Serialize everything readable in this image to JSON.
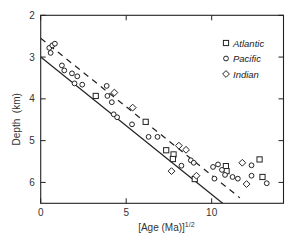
{
  "chart_data": {
    "type": "scatter",
    "title": "",
    "xlabel": "[Age (Ma)]",
    "xlabel_superscript": "1/2",
    "ylabel": "Depth  (km)",
    "xlim": [
      0,
      14.2
    ],
    "ylim": [
      6.5,
      2
    ],
    "y_inverted": true,
    "x_ticks": [
      0,
      5,
      10
    ],
    "x_tick_labels": [
      "0",
      "5",
      "10"
    ],
    "y_ticks": [
      2,
      3,
      4,
      5,
      6
    ],
    "y_tick_labels": [
      "2",
      "3",
      "4",
      "5",
      "6"
    ],
    "grid": false,
    "legend_position": "upper right",
    "series": [
      {
        "name": "Atlantic",
        "marker": "square",
        "points": [
          [
            3.22,
            3.93
          ],
          [
            6.14,
            4.55
          ],
          [
            7.34,
            5.23
          ],
          [
            7.77,
            5.33
          ],
          [
            7.73,
            5.44
          ],
          [
            9.01,
            5.92
          ],
          [
            10.83,
            5.61
          ],
          [
            10.87,
            5.73
          ],
          [
            12.8,
            5.45
          ],
          [
            12.97,
            5.87
          ]
        ]
      },
      {
        "name": "Pacific",
        "marker": "circle",
        "points": [
          [
            0.5,
            2.78
          ],
          [
            0.58,
            2.9
          ],
          [
            0.68,
            2.72
          ],
          [
            0.83,
            2.68
          ],
          [
            1.24,
            3.2
          ],
          [
            1.38,
            3.32
          ],
          [
            1.83,
            3.39
          ],
          [
            2.14,
            3.46
          ],
          [
            1.98,
            3.63
          ],
          [
            2.43,
            3.66
          ],
          [
            3.86,
            3.69
          ],
          [
            3.9,
            3.93
          ],
          [
            4.16,
            4.08
          ],
          [
            4.27,
            4.37
          ],
          [
            4.47,
            4.44
          ],
          [
            5.34,
            4.61
          ],
          [
            6.31,
            4.91
          ],
          [
            6.83,
            4.91
          ],
          [
            8.78,
            5.47
          ],
          [
            8.95,
            5.53
          ],
          [
            8.23,
            5.6
          ],
          [
            10.08,
            5.63
          ],
          [
            10.37,
            5.57
          ],
          [
            10.6,
            5.7
          ],
          [
            10.16,
            5.91
          ],
          [
            10.78,
            5.82
          ],
          [
            11.22,
            5.87
          ],
          [
            11.53,
            5.91
          ],
          [
            12.33,
            5.59
          ],
          [
            12.33,
            5.84
          ],
          [
            13.22,
            6.02
          ]
        ]
      },
      {
        "name": "Indian",
        "marker": "diamond",
        "points": [
          [
            4.31,
            3.85
          ],
          [
            5.38,
            4.21
          ],
          [
            8.08,
            5.12
          ],
          [
            8.5,
            5.22
          ],
          [
            7.65,
            5.73
          ],
          [
            9.11,
            5.84
          ],
          [
            11.79,
            5.53
          ],
          [
            12.04,
            6.04
          ]
        ]
      }
    ],
    "lines": [
      {
        "name": "solid-fit",
        "style": "solid",
        "points": [
          [
            0,
            3.0
          ],
          [
            10.64,
            6.5
          ]
        ]
      },
      {
        "name": "dashed-fit",
        "style": "dashed",
        "points": [
          [
            0,
            2.55
          ],
          [
            11.65,
            6.37
          ]
        ]
      }
    ]
  },
  "legend": {
    "items": [
      {
        "label": "Atlantic",
        "marker": "square"
      },
      {
        "label": "Pacific",
        "marker": "circle"
      },
      {
        "label": "Indian",
        "marker": "diamond"
      }
    ]
  }
}
